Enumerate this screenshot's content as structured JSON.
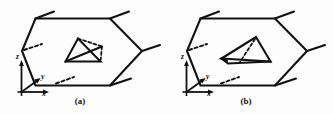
{
  "figure": {
    "background_color": "#fdfdfd",
    "line_color": "#111111",
    "panels": [
      {
        "id": "a",
        "label": "(a)",
        "inner_shape": "triangle-with-dashed-parallelogram",
        "axes": {
          "x_label": "x",
          "y_label": "y",
          "z_label": "z"
        }
      },
      {
        "id": "b",
        "label": "(b)",
        "inner_shape": "tilted-triangle-with-dashed-edge",
        "axes": {
          "x_label": "x",
          "y_label": "y",
          "z_label": "z"
        }
      }
    ]
  }
}
